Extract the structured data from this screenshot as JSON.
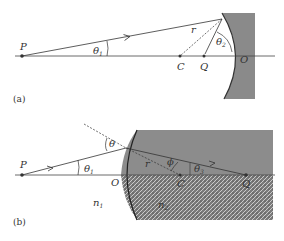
{
  "panels": [
    {
      "id": "a",
      "caption": "(a)",
      "labels": {
        "P": "P",
        "C": "C",
        "Q": "Q",
        "O": "O",
        "r": "r",
        "theta1": "θ",
        "theta1_sub": "1",
        "theta2": "θ",
        "theta2_sub": "2"
      },
      "description": "Concave spherical mirror: ray from point P reflects to image Q; C is center of curvature, O is vertex"
    },
    {
      "id": "b",
      "caption": "(b)",
      "labels": {
        "P": "P",
        "O": "O",
        "C": "C",
        "Q": "Q",
        "r": "r",
        "theta": "θ",
        "theta1": "θ",
        "theta1_sub": "1",
        "phi": "ϕ",
        "theta3": "θ",
        "theta3_sub": "3",
        "n1": "n",
        "n1_sub": "1",
        "n2": "n",
        "n2_sub": "2"
      },
      "description": "Refraction at a convex spherical surface between media n1 and n2"
    }
  ],
  "colors": {
    "line": "#333333",
    "mirror": "#8a8a8a",
    "medium": "#8c8c8c"
  }
}
